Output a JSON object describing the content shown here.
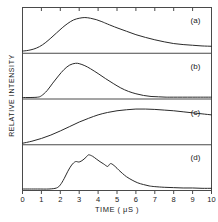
{
  "chart_data": {
    "type": "line",
    "title": "",
    "xlabel": "TIME ( μS )",
    "ylabel": "RELATIVE INTENSITY",
    "xlim": [
      0,
      10
    ],
    "ylim": [
      0,
      1
    ],
    "grid": false,
    "legend_position": "panel-corner",
    "xticks": [
      0,
      1,
      2,
      3,
      4,
      5,
      6,
      7,
      8,
      9,
      10
    ],
    "xticklabels": [
      "0",
      "1",
      "2",
      "3",
      "4",
      "5",
      "6",
      "7",
      "8",
      "9",
      "10"
    ],
    "panels": [
      {
        "label": "(a)",
        "x": [
          0.0,
          0.3,
          0.6,
          0.9,
          1.2,
          1.5,
          1.8,
          2.1,
          2.4,
          2.7,
          3.0,
          3.3,
          3.6,
          3.9,
          4.2,
          4.5,
          5.0,
          5.5,
          6.0,
          6.5,
          7.0,
          7.5,
          8.0,
          8.5,
          9.0,
          9.5,
          10.0
        ],
        "y": [
          0.02,
          0.04,
          0.08,
          0.15,
          0.26,
          0.4,
          0.55,
          0.7,
          0.83,
          0.93,
          0.98,
          1.0,
          0.98,
          0.94,
          0.88,
          0.81,
          0.7,
          0.6,
          0.5,
          0.42,
          0.35,
          0.29,
          0.24,
          0.21,
          0.19,
          0.17,
          0.16
        ]
      },
      {
        "label": "(b)",
        "x": [
          0.0,
          0.4,
          0.8,
          1.0,
          1.3,
          1.6,
          1.9,
          2.2,
          2.5,
          2.8,
          3.0,
          3.3,
          3.6,
          4.0,
          4.4,
          4.8,
          5.2,
          5.6,
          6.0,
          6.4,
          6.8,
          7.2,
          7.6,
          8.0,
          9.0,
          10.0
        ],
        "y": [
          0.0,
          0.0,
          0.01,
          0.05,
          0.2,
          0.42,
          0.63,
          0.82,
          0.95,
          1.0,
          0.99,
          0.93,
          0.84,
          0.7,
          0.55,
          0.41,
          0.28,
          0.18,
          0.11,
          0.06,
          0.03,
          0.02,
          0.01,
          0.01,
          0.01,
          0.01
        ]
      },
      {
        "label": "(c)",
        "x": [
          0.0,
          0.5,
          1.0,
          1.5,
          2.0,
          2.5,
          3.0,
          3.5,
          4.0,
          4.5,
          5.0,
          5.5,
          6.0,
          6.5,
          7.0,
          7.5,
          8.0,
          8.5,
          9.0,
          9.5,
          10.0
        ],
        "y": [
          0.0,
          0.06,
          0.14,
          0.24,
          0.36,
          0.49,
          0.62,
          0.73,
          0.83,
          0.9,
          0.95,
          0.98,
          1.0,
          1.0,
          0.99,
          0.97,
          0.95,
          0.92,
          0.89,
          0.86,
          0.83
        ]
      },
      {
        "label": "(d)",
        "x": [
          0.0,
          0.8,
          1.4,
          1.8,
          2.0,
          2.2,
          2.4,
          2.6,
          2.8,
          3.0,
          3.2,
          3.4,
          3.5,
          3.7,
          3.9,
          4.1,
          4.3,
          4.5,
          4.6,
          4.7,
          4.9,
          5.1,
          5.3,
          5.5,
          5.8,
          6.1,
          6.4,
          6.7,
          7.0,
          7.5,
          8.0,
          8.5,
          9.0,
          9.5,
          10.0
        ],
        "y": [
          0.0,
          0.0,
          0.0,
          0.03,
          0.12,
          0.3,
          0.52,
          0.7,
          0.8,
          0.79,
          0.85,
          0.95,
          1.0,
          0.96,
          0.88,
          0.8,
          0.73,
          0.66,
          0.72,
          0.74,
          0.66,
          0.55,
          0.45,
          0.36,
          0.26,
          0.18,
          0.13,
          0.09,
          0.07,
          0.05,
          0.04,
          0.03,
          0.03,
          0.02,
          0.02
        ]
      }
    ]
  },
  "axes": {
    "ylabel": "RELATIVE INTENSITY",
    "xlabel": "TIME ( μS )"
  },
  "style": {
    "line_color": "#2a2a2a",
    "frame_color": "#4a4a4a",
    "background": "#ffffff"
  }
}
